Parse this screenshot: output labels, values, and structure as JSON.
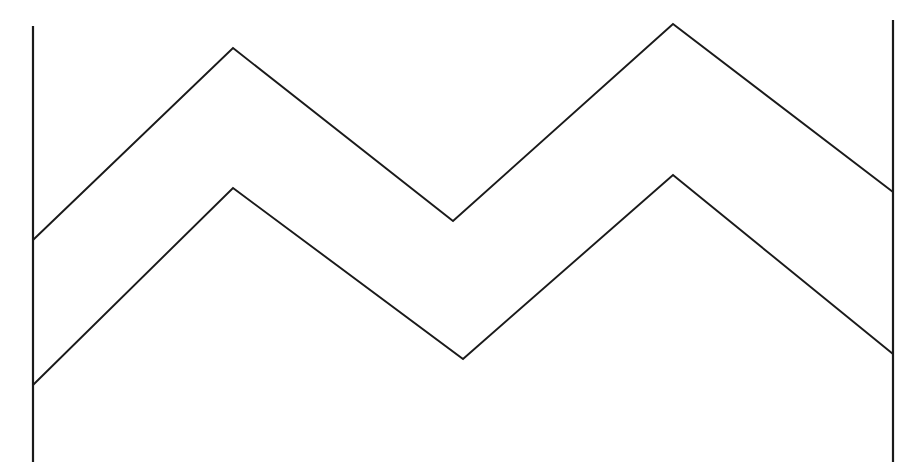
{
  "figure": {
    "background_color": "#ffffff",
    "stroke_color": "#1a1a1a",
    "width": 924,
    "height": 473
  },
  "chart_data": {
    "type": "line",
    "xlabel": "",
    "ylabel": "",
    "xlim": [
      0,
      924
    ],
    "ylim": [
      473,
      0
    ],
    "grid": false,
    "legend": "none",
    "note": "Screen pixel coordinates; y increases downward. Two congruent chevron polylines offset vertically by about 140 px, bounded left and right by vertical line segments.",
    "series": [
      {
        "name": "upper-zigzag",
        "stroke": "#1a1a1a",
        "stroke_width": 1.9,
        "points": [
          {
            "x": 33,
            "y": 240
          },
          {
            "x": 233,
            "y": 48
          },
          {
            "x": 453,
            "y": 221
          },
          {
            "x": 673,
            "y": 24
          },
          {
            "x": 893,
            "y": 192
          }
        ]
      },
      {
        "name": "lower-zigzag",
        "stroke": "#1a1a1a",
        "stroke_width": 1.9,
        "points": [
          {
            "x": 33,
            "y": 385
          },
          {
            "x": 233,
            "y": 188
          },
          {
            "x": 463,
            "y": 359
          },
          {
            "x": 673,
            "y": 175
          },
          {
            "x": 893,
            "y": 354
          }
        ]
      }
    ],
    "rails": [
      {
        "name": "left-rail",
        "x": 33,
        "y_top": 26,
        "y_bottom": 462,
        "stroke": "#1a1a1a",
        "stroke_width": 2.2
      },
      {
        "name": "right-rail",
        "x": 893,
        "y_top": 20,
        "y_bottom": 462,
        "stroke": "#1a1a1a",
        "stroke_width": 2.2
      }
    ],
    "vertices": {
      "upper_peak_1": {
        "x": 233,
        "y": 48
      },
      "upper_valley": {
        "x": 453,
        "y": 221
      },
      "upper_peak_2": {
        "x": 673,
        "y": 24
      },
      "lower_peak_1": {
        "x": 233,
        "y": 188
      },
      "lower_valley": {
        "x": 463,
        "y": 359
      },
      "lower_peak_2": {
        "x": 673,
        "y": 175
      }
    }
  }
}
